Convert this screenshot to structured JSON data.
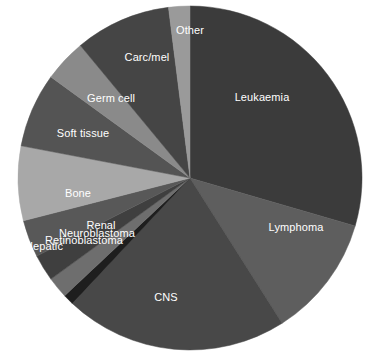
{
  "chart_data": {
    "type": "pie",
    "title": "",
    "subtitle": "",
    "xlabel": "",
    "ylabel": "",
    "legend_position": "none",
    "grid": false,
    "labels_inside_slices": true,
    "label_color": "#ffffff",
    "background_color": "#ffffff",
    "center": {
      "x": 190,
      "y": 178
    },
    "radius": 172,
    "start_angle_deg": -90,
    "direction": "clockwise",
    "categories": [
      "Leukaemia",
      "Lymphoma",
      "CNS",
      "Hepatic",
      "Retinoblastoma",
      "Neuroblastoma",
      "Renal",
      "Bone",
      "Soft tissue",
      "Germ cell",
      "Carc/mel",
      "Other"
    ],
    "values": [
      29.5,
      11.5,
      21.0,
      1.0,
      2.0,
      2.5,
      3.5,
      7.0,
      7.0,
      4.0,
      9.0,
      2.0
    ],
    "colors": [
      "#3b3b3b",
      "#5e5e5e",
      "#484848",
      "#1e1e1e",
      "#6e6e6e",
      "#3f3f3f",
      "#585858",
      "#a8a8a8",
      "#545454",
      "#8a8a8a",
      "#454545",
      "#9a9a9a"
    ],
    "slices": [
      {
        "name": "Leukaemia",
        "label": "Leukaemia",
        "value": 29.5,
        "color": "#3b3b3b",
        "start_angle_deg": -90,
        "end_angle_deg": 16.2,
        "label_x": 262,
        "label_y": 97
      },
      {
        "name": "Lymphoma",
        "label": "Lymphoma",
        "value": 11.5,
        "color": "#5e5e5e",
        "start_angle_deg": 16.2,
        "end_angle_deg": 57.6,
        "label_x": 296,
        "label_y": 227
      },
      {
        "name": "CNS",
        "label": "CNS",
        "value": 21.0,
        "color": "#484848",
        "start_angle_deg": 57.6,
        "end_angle_deg": 133.2,
        "label_x": 166,
        "label_y": 297
      },
      {
        "name": "Hepatic",
        "label": "Hepatic",
        "value": 1.0,
        "color": "#1e1e1e",
        "start_angle_deg": 133.2,
        "end_angle_deg": 136.8,
        "label_x": 44,
        "label_y": 246
      },
      {
        "name": "Retinoblastoma",
        "label": "Retinoblastoma",
        "value": 2.0,
        "color": "#6e6e6e",
        "start_angle_deg": 136.8,
        "end_angle_deg": 144.0,
        "label_x": 84,
        "label_y": 240
      },
      {
        "name": "Neuroblastoma",
        "label": "Neuroblastoma",
        "value": 2.5,
        "color": "#3f3f3f",
        "start_angle_deg": 144.0,
        "end_angle_deg": 153.0,
        "label_x": 97,
        "label_y": 233
      },
      {
        "name": "Renal",
        "label": "Renal",
        "value": 3.5,
        "color": "#585858",
        "start_angle_deg": 153.0,
        "end_angle_deg": 165.6,
        "label_x": 101,
        "label_y": 225
      },
      {
        "name": "Bone",
        "label": "Bone",
        "value": 7.0,
        "color": "#a8a8a8",
        "start_angle_deg": 165.6,
        "end_angle_deg": 190.8,
        "label_x": 78,
        "label_y": 193
      },
      {
        "name": "Soft tissue",
        "label": "Soft tissue",
        "value": 7.0,
        "color": "#545454",
        "start_angle_deg": 190.8,
        "end_angle_deg": 216.0,
        "label_x": 83,
        "label_y": 133
      },
      {
        "name": "Germ cell",
        "label": "Germ cell",
        "value": 4.0,
        "color": "#8a8a8a",
        "start_angle_deg": 216.0,
        "end_angle_deg": 230.4,
        "label_x": 111,
        "label_y": 98
      },
      {
        "name": "Carc/mel",
        "label": "Carc/mel",
        "value": 9.0,
        "color": "#454545",
        "start_angle_deg": 230.4,
        "end_angle_deg": 262.8,
        "label_x": 147,
        "label_y": 57
      },
      {
        "name": "Other",
        "label": "Other",
        "value": 2.0,
        "color": "#9a9a9a",
        "start_angle_deg": 262.8,
        "end_angle_deg": 270.0,
        "label_x": 190,
        "label_y": 30
      }
    ]
  }
}
